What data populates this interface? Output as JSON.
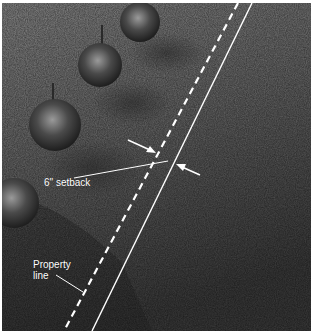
{
  "image": {
    "description": "Aerial photograph of a grass lawn with young spruce trees along the left, a dashed white property line and a parallel solid white setback line",
    "colors": {
      "grass_light": "#8a8a8a",
      "grass_dark": "#3a3a3a",
      "tree": "#2e2e2e",
      "annotation": "#ffffff",
      "border": "#ffffff"
    }
  },
  "annotations": {
    "setback_label": "6\" setback",
    "property_label": "Property line"
  },
  "lines": {
    "property_line": {
      "style": "dashed",
      "x1": 236,
      "y1": 0,
      "x2": 62,
      "y2": 328
    },
    "setback_line": {
      "style": "solid",
      "x1": 250,
      "y1": 0,
      "x2": 90,
      "y2": 328
    }
  },
  "trees": [
    {
      "name": "spruce-1",
      "cx": 138,
      "cy": 19,
      "r": 20
    },
    {
      "name": "spruce-2",
      "cx": 98,
      "cy": 62,
      "r": 22
    },
    {
      "name": "spruce-3",
      "cx": 53,
      "cy": 122,
      "r": 26
    },
    {
      "name": "spruce-4",
      "cx": 12,
      "cy": 200,
      "r": 25
    }
  ]
}
